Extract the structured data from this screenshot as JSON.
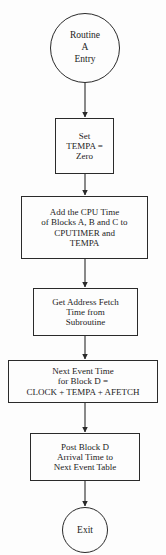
{
  "diagram": {
    "background_color": "#fdfdfd",
    "stroke_color": "#2a2a2a",
    "text_color": "#1c1c1c",
    "nodes": [
      {
        "id": "start",
        "shape": "terminator-circle",
        "lines": [
          "Routine",
          "A",
          "Entry"
        ]
      },
      {
        "id": "set-tempa",
        "shape": "process-box",
        "lines": [
          "Set",
          "TEMPA =",
          "Zero"
        ]
      },
      {
        "id": "add-cpu-time",
        "shape": "process-box",
        "lines": [
          "Add the CPU Time",
          "of Blocks A, B and C to",
          "CPUTIMER and",
          "TEMPA"
        ]
      },
      {
        "id": "get-address-fetch",
        "shape": "process-box",
        "lines": [
          "Get Address Fetch",
          "Time from",
          "Subroutine"
        ]
      },
      {
        "id": "next-event-time",
        "shape": "process-box",
        "lines": [
          "Next Event Time",
          "for Block D =",
          "CLOCK + TEMPA + AFETCH"
        ]
      },
      {
        "id": "post-block-d",
        "shape": "process-box",
        "lines": [
          "Post Block D",
          "Arrival Time to",
          "Next Event Table"
        ]
      },
      {
        "id": "exit",
        "shape": "terminator-circle",
        "lines": [
          "Exit"
        ]
      }
    ],
    "connectors": [
      {
        "id": "start-to-set",
        "from": "start",
        "to": "set-tempa",
        "arrow": "down"
      },
      {
        "id": "set-to-add",
        "from": "set-tempa",
        "to": "add-cpu-time",
        "arrow": "down"
      },
      {
        "id": "add-to-fetch",
        "from": "add-cpu-time",
        "to": "get-address-fetch",
        "arrow": "down"
      },
      {
        "id": "fetch-to-next",
        "from": "get-address-fetch",
        "to": "next-event-time",
        "arrow": "down"
      },
      {
        "id": "next-to-post",
        "from": "next-event-time",
        "to": "post-block-d",
        "arrow": "down"
      },
      {
        "id": "post-to-exit",
        "from": "post-block-d",
        "to": "exit",
        "arrow": "down"
      }
    ]
  }
}
